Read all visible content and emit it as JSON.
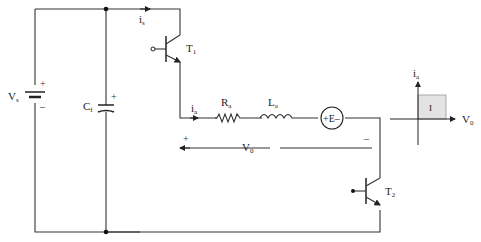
{
  "diagram": {
    "type": "circuit",
    "title": "",
    "components": {
      "source": {
        "label": "V",
        "sub": "s",
        "plus": "+",
        "minus": "–"
      },
      "capacitor": {
        "label": "C",
        "sub": "f",
        "plus": "+"
      },
      "switch_top": {
        "label": "T",
        "sub": "1"
      },
      "switch_bottom": {
        "label": "T",
        "sub": "2"
      },
      "resistor": {
        "label": "R",
        "sub": "a"
      },
      "inductor": {
        "label": "L",
        "sub": "a"
      },
      "emf": {
        "label": "+E–"
      }
    },
    "currents": {
      "supply": {
        "label": "i",
        "sub": "s"
      },
      "armature": {
        "label": "i",
        "sub": "a"
      }
    },
    "output_voltage": {
      "label": "V",
      "sub": "0",
      "plus": "+",
      "minus": "–"
    },
    "quadrant_plot": {
      "y_axis": {
        "label": "i",
        "sub": "a"
      },
      "x_axis": {
        "label": "V",
        "sub": "0"
      },
      "quadrant_label": "I",
      "fill_color": "#e3e3e3"
    },
    "colors": {
      "wire": "#333333",
      "text": "#222222",
      "quadrant_fill": "#e3e3e3"
    }
  }
}
